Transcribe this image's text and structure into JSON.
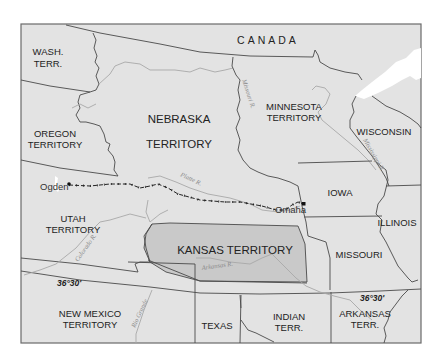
{
  "map": {
    "colors": {
      "land": "#e3e3e3",
      "kansas_highlight": "#c9c9c9",
      "water": "#ffffff",
      "border": "#4a4a4a",
      "river": "#a8a8a8",
      "railroad": "#222222"
    },
    "regions": {
      "canada": "CANADA",
      "wash_line1": "WASH.",
      "wash_line2": "TERR.",
      "oregon_line1": "OREGON",
      "oregon_line2": "TERRITORY",
      "nebraska_line1": "NEBRASKA",
      "nebraska_line2": "TERRITORY",
      "minnesota_line1": "MINNESOTA",
      "minnesota_line2": "TERRITORY",
      "wisconsin": "WISCONSIN",
      "iowa": "IOWA",
      "illinois": "ILLINOIS",
      "utah_line1": "UTAH",
      "utah_line2": "TERRITORY",
      "kansas": "KANSAS TERRITORY",
      "missouri": "MISSOURI",
      "new_mexico_line1": "NEW MEXICO",
      "new_mexico_line2": "TERRITORY",
      "texas": "TEXAS",
      "indian_line1": "INDIAN",
      "indian_line2": "TERR.",
      "arkansas_line1": "ARKANSAS",
      "arkansas_line2": "TERR."
    },
    "cities": {
      "ogden": "Ogden",
      "omaha": "Omaha"
    },
    "rivers": {
      "missouri": "Missouri R.",
      "mississippi": "Mississippi R.",
      "platte": "Platte R.",
      "colorado": "Colorado R.",
      "arkansas": "Arkansas R.",
      "rio_grande": "Rio Grande"
    },
    "latitude_labels": {
      "west": "36°30'",
      "east": "36°30'"
    }
  }
}
